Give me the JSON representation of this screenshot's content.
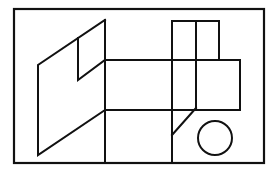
{
  "canvas": {
    "width": 277,
    "height": 178,
    "background_color": "#ffffff",
    "title": "Line drawing of overlapping geometric solids"
  },
  "style": {
    "stroke_color": "#111111",
    "frame_stroke_width": 2.2,
    "shape_stroke_width": 2.0,
    "fill": "none"
  },
  "figure": {
    "frame": {
      "name": "outer-border",
      "x": 14,
      "y": 9,
      "width": 250,
      "height": 154
    },
    "shapes": [
      {
        "name": "left-parallelogram-panel",
        "type": "polyline",
        "closed": false,
        "points": "105,20 38,65 38,155 105,110 105,20"
      },
      {
        "name": "panel-notch-cut",
        "type": "polyline",
        "closed": false,
        "points": "105,60 78,80 78,38"
      },
      {
        "name": "top-square-box",
        "type": "rect",
        "x": 172,
        "y": 21,
        "width": 47,
        "height": 39
      },
      {
        "name": "middle-horizontal-band",
        "type": "rect",
        "x": 105,
        "y": 60,
        "width": 135,
        "height": 50
      },
      {
        "name": "right-square-face",
        "type": "rect",
        "x": 196,
        "y": 60,
        "width": 44,
        "height": 50
      },
      {
        "name": "bottom-rectangle",
        "type": "rect",
        "x": 105,
        "y": 110,
        "width": 67,
        "height": 53
      },
      {
        "name": "vertical-edge-through-band",
        "type": "line",
        "x1": 172,
        "y1": 21,
        "x2": 172,
        "y2": 163
      },
      {
        "name": "vertical-edge-right-of-box",
        "type": "line",
        "x1": 196,
        "y1": 21,
        "x2": 196,
        "y2": 110
      },
      {
        "name": "diagonal-bevel-line",
        "type": "line",
        "x1": 196,
        "y1": 108,
        "x2": 172,
        "y2": 135
      },
      {
        "name": "circle-shape",
        "type": "circle",
        "cx": 215,
        "cy": 138,
        "r": 17
      }
    ]
  }
}
